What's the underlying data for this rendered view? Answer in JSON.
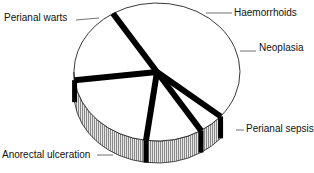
{
  "chart_data": {
    "type": "pie",
    "style": "3d-exploded",
    "title": "",
    "categories": [
      "Perianal warts",
      "Haemorrhoids",
      "Neoplasia",
      "Perianal sepsis",
      "Anorectal ulceration"
    ],
    "values": [
      45,
      5,
      11,
      21,
      18
    ],
    "unit": "percent (estimated)",
    "colors": {
      "face": "#ffffff",
      "side": "#bdbdbd",
      "separator": "#000000",
      "outline": "#222222"
    }
  }
}
